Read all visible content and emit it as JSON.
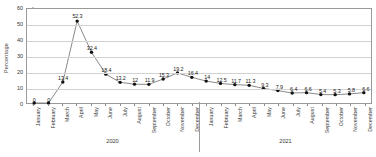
{
  "chart_data": {
    "type": "line",
    "title": "",
    "xlabel": "",
    "ylabel": "Percentage",
    "ylim": [
      0,
      60
    ],
    "yticks": [
      0,
      10,
      20,
      30,
      40,
      50,
      60
    ],
    "grid": true,
    "legend": "none",
    "categories": [
      "January",
      "February",
      "March",
      "April",
      "May",
      "June",
      "July",
      "August",
      "September",
      "October",
      "November",
      "December",
      "January",
      "February",
      "March",
      "April",
      "May",
      "June",
      "July",
      "August",
      "September",
      "October",
      "November",
      "December"
    ],
    "groups": [
      {
        "label": "2020",
        "start": 0,
        "end": 11
      },
      {
        "label": "2021",
        "start": 12,
        "end": 23
      }
    ],
    "values": [
      0,
      0,
      13.4,
      52.3,
      32.4,
      18.4,
      13.2,
      12,
      11.9,
      15.3,
      19.2,
      16.4,
      14,
      12.5,
      11.7,
      11.3,
      9.3,
      7.9,
      6.4,
      6.6,
      5.4,
      5.3,
      5.8,
      6.6
    ],
    "data_labels": [
      "0",
      "0",
      "13.4",
      "52.3",
      "32.4",
      "18.4",
      "13.2",
      "12",
      "11.9",
      "15.3",
      "19.2",
      "16.4",
      "14",
      "12.5",
      "11.7",
      "11.3",
      "9.3",
      "7.9",
      "6.4",
      "6.6",
      "5.4",
      "5.3",
      "5.8",
      "6.6"
    ],
    "series": [
      {
        "name": "Percentage",
        "color": "#555555",
        "marker": "circle",
        "marker_color": "#111111",
        "values": [
          0,
          0,
          13.4,
          52.3,
          32.4,
          18.4,
          13.2,
          12,
          11.9,
          15.3,
          19.2,
          16.4,
          14,
          12.5,
          11.7,
          11.3,
          9.3,
          7.9,
          6.4,
          6.6,
          5.4,
          5.3,
          5.8,
          6.6
        ]
      }
    ]
  }
}
